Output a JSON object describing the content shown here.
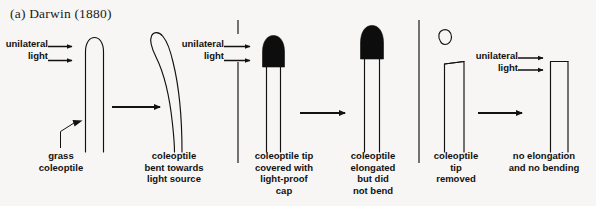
{
  "figure": {
    "title": "(a) Darwin (1880)",
    "background_color": "#f7f6f4",
    "ink_color": "#121212"
  },
  "light_labels": {
    "panel1": "unilateral\nlight",
    "panel2": "unilateral\nlight",
    "panel3": "unilateral\nlight"
  },
  "panels": [
    {
      "id": "panel-1-control",
      "stages": [
        {
          "id": "stage-grass-coleoptile",
          "caption": "grass\ncoleoptile",
          "tip": "intact-rounded",
          "bent": false
        },
        {
          "id": "stage-bent-coleoptile",
          "caption": "coleoptile\nbent towards\nlight source",
          "tip": "intact-rounded",
          "bent": true
        }
      ]
    },
    {
      "id": "panel-2-capped",
      "stages": [
        {
          "id": "stage-capped-tip",
          "caption": "coleoptile tip\ncovered with\nlight-proof\ncap",
          "tip": "black-cap",
          "bent": false
        },
        {
          "id": "stage-elongated-no-bend",
          "caption": "coleoptile\nelongated\nbut did\nnot bend",
          "tip": "black-cap",
          "bent": false
        }
      ]
    },
    {
      "id": "panel-3-decapitated",
      "stages": [
        {
          "id": "stage-tip-removed",
          "caption": "coleoptile\ntip\nremoved",
          "tip": "cut-flat",
          "bent": false
        },
        {
          "id": "stage-no-growth",
          "caption": "no elongation\nand no bending",
          "tip": "cut-flat",
          "bent": false
        }
      ]
    }
  ]
}
